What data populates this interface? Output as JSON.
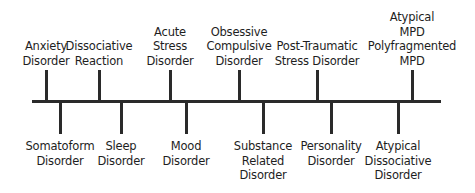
{
  "diagram": {
    "type": "timeline",
    "axis": {
      "x_start": 32,
      "x_end": 441,
      "y": 101,
      "color": "#2a2a2a"
    },
    "above": [
      {
        "x": 46,
        "lines": [
          "Anxiety",
          "Disorder"
        ]
      },
      {
        "x": 99,
        "lines": [
          "Dissociative",
          "Reaction"
        ]
      },
      {
        "x": 170,
        "lines": [
          "Acute",
          "Stress",
          "Disorder"
        ]
      },
      {
        "x": 239,
        "lines": [
          "Obsessive",
          "Compulsive",
          "Disorder"
        ]
      },
      {
        "x": 317,
        "lines": [
          "Post-Traumatic",
          "Stress Disorder"
        ]
      },
      {
        "x": 412,
        "lines": [
          "Atypical",
          "MPD",
          "Polyfragmented",
          "MPD"
        ]
      }
    ],
    "below": [
      {
        "x": 60,
        "lines": [
          "Somatoform",
          "Disorder"
        ]
      },
      {
        "x": 121,
        "lines": [
          "Sleep",
          "Disorder"
        ]
      },
      {
        "x": 186,
        "lines": [
          "Mood",
          "Disorder"
        ]
      },
      {
        "x": 263,
        "lines": [
          "Substance",
          "Related",
          "Disorder"
        ]
      },
      {
        "x": 331,
        "lines": [
          "Personality",
          "Disorder"
        ]
      },
      {
        "x": 398,
        "lines": [
          "Atypical",
          "Dissociative",
          "Disorder"
        ]
      }
    ]
  }
}
